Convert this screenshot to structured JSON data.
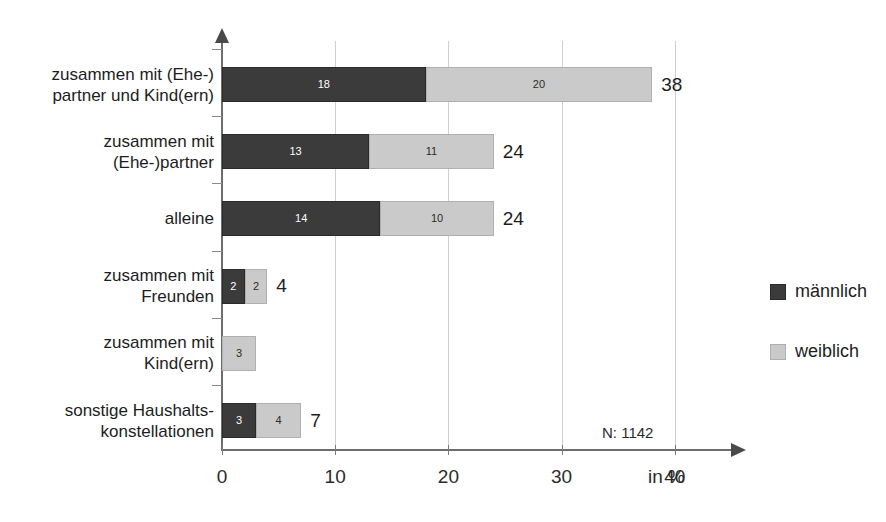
{
  "title_remnant": "",
  "chart_data": {
    "type": "bar",
    "orientation": "horizontal",
    "stacked": true,
    "title": "",
    "xlabel": "in %",
    "ylabel": "",
    "xlim": [
      0,
      40
    ],
    "xticks": [
      0,
      10,
      20,
      30,
      40
    ],
    "xtick_labels": [
      "0",
      "10",
      "20",
      "30",
      "40"
    ],
    "grid": "vertical",
    "legend_position": "right",
    "annotation": "N: 1142",
    "categories": [
      "zusammen mit (Ehe-)\npartner und Kind(ern)",
      "zusammen mit\n(Ehe-)partner",
      "alleine",
      "zusammen mit\nFreunden",
      "zusammen mit\nKind(ern)",
      "sonstige Haushalts-\nkonstellationen"
    ],
    "series": [
      {
        "name": "männlich",
        "color": "#3b3b3b",
        "values": [
          18,
          13,
          14,
          2,
          0,
          3
        ]
      },
      {
        "name": "weiblich",
        "color": "#cacaca",
        "values": [
          20,
          11,
          10,
          2,
          3,
          4
        ]
      }
    ],
    "totals": [
      38,
      24,
      24,
      4,
      null,
      7
    ],
    "bar_value_labels": [
      {
        "male": "18",
        "female": "20",
        "total": "38"
      },
      {
        "male": "13",
        "female": "11",
        "total": "24"
      },
      {
        "male": "14",
        "female": "10",
        "total": "24"
      },
      {
        "male": "2",
        "female": "2",
        "total": "4"
      },
      {
        "male": "",
        "female": "3",
        "total": ""
      },
      {
        "male": "3",
        "female": "4",
        "total": "7"
      }
    ]
  },
  "legend": {
    "items": [
      {
        "label": "männlich",
        "color": "#3b3b3b"
      },
      {
        "label": "weiblich",
        "color": "#cacaca"
      }
    ]
  }
}
